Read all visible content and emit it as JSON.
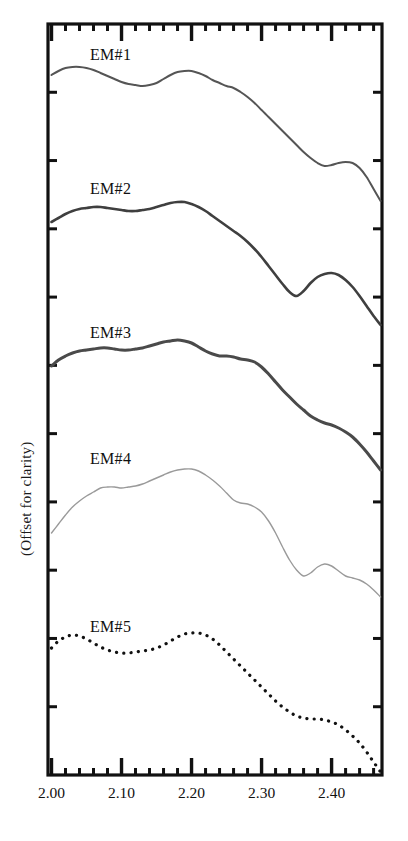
{
  "chart_data": {
    "type": "line",
    "title": "",
    "xlabel": "",
    "ylabel": "(Offset for clarity)",
    "xlim": [
      1.995,
      2.472
    ],
    "ylim": [
      0,
      1
    ],
    "grid": false,
    "legend_position": "inline-curve-labels",
    "xticks_major": [
      "2.00",
      "2.10",
      "2.20",
      "2.30",
      "2.40"
    ],
    "xtick_major_values": [
      2.0,
      2.1,
      2.2,
      2.3,
      2.4
    ],
    "xtick_minor_step": 0.02,
    "xtick_medium_step": 0.05,
    "ytick_count": 11,
    "series": [
      {
        "name": "EM#1",
        "label": "EM#1",
        "color": "#555555",
        "style": "solid",
        "width": 2.0,
        "label_x": 2.055,
        "label_y_px": 62,
        "x": [
          2.0,
          2.01,
          2.02,
          2.03,
          2.04,
          2.05,
          2.06,
          2.07,
          2.08,
          2.09,
          2.1,
          2.11,
          2.12,
          2.13,
          2.14,
          2.15,
          2.16,
          2.17,
          2.18,
          2.19,
          2.2,
          2.21,
          2.22,
          2.23,
          2.24,
          2.25,
          2.26,
          2.27,
          2.28,
          2.29,
          2.3,
          2.31,
          2.32,
          2.33,
          2.34,
          2.35,
          2.36,
          2.37,
          2.38,
          2.39,
          2.4,
          2.41,
          2.42,
          2.43,
          2.44,
          2.45,
          2.46,
          2.47
        ],
        "y_px": [
          75,
          71,
          68,
          67,
          67,
          68,
          70,
          73,
          76,
          79,
          82,
          84,
          85,
          86,
          85,
          83,
          79,
          75,
          72,
          71,
          71,
          73,
          76,
          80,
          83,
          86,
          88,
          92,
          97,
          103,
          110,
          117,
          124,
          131,
          138,
          145,
          152,
          158,
          163,
          166,
          165,
          163,
          162,
          163,
          168,
          177,
          189,
          201
        ]
      },
      {
        "name": "EM#2",
        "label": "EM#2",
        "color": "#3f3f3f",
        "style": "solid",
        "width": 2.6,
        "label_x": 2.055,
        "label_y_px": 196,
        "x": [
          2.0,
          2.01,
          2.02,
          2.03,
          2.04,
          2.05,
          2.06,
          2.07,
          2.08,
          2.09,
          2.1,
          2.11,
          2.12,
          2.13,
          2.14,
          2.15,
          2.16,
          2.17,
          2.18,
          2.19,
          2.2,
          2.21,
          2.22,
          2.23,
          2.24,
          2.25,
          2.26,
          2.27,
          2.28,
          2.29,
          2.3,
          2.31,
          2.32,
          2.33,
          2.34,
          2.35,
          2.36,
          2.37,
          2.38,
          2.39,
          2.4,
          2.41,
          2.42,
          2.43,
          2.44,
          2.45,
          2.46,
          2.47
        ],
        "y_px": [
          222,
          218,
          214,
          211,
          209,
          208,
          207,
          207,
          208,
          209,
          210,
          211,
          211,
          210,
          209,
          207,
          205,
          203,
          202,
          202,
          204,
          207,
          211,
          216,
          221,
          226,
          231,
          236,
          242,
          249,
          257,
          266,
          275,
          284,
          292,
          296,
          291,
          283,
          277,
          274,
          273,
          275,
          280,
          287,
          296,
          306,
          316,
          325
        ]
      },
      {
        "name": "EM#3",
        "label": "EM#3",
        "color": "#4a4a4a",
        "style": "solid",
        "width": 3.0,
        "label_x": 2.055,
        "label_y_px": 340,
        "x": [
          2.0,
          2.01,
          2.02,
          2.03,
          2.04,
          2.05,
          2.06,
          2.07,
          2.08,
          2.09,
          2.1,
          2.11,
          2.12,
          2.13,
          2.14,
          2.15,
          2.16,
          2.17,
          2.18,
          2.19,
          2.2,
          2.21,
          2.22,
          2.23,
          2.24,
          2.25,
          2.26,
          2.27,
          2.28,
          2.29,
          2.3,
          2.31,
          2.32,
          2.33,
          2.34,
          2.35,
          2.36,
          2.37,
          2.38,
          2.39,
          2.4,
          2.41,
          2.42,
          2.43,
          2.44,
          2.45,
          2.46,
          2.47
        ],
        "y_px": [
          366,
          360,
          356,
          353,
          351,
          350,
          349,
          348,
          348,
          349,
          350,
          350,
          349,
          348,
          346,
          344,
          342,
          341,
          340,
          341,
          343,
          347,
          351,
          354,
          356,
          356,
          357,
          359,
          360,
          362,
          367,
          374,
          382,
          390,
          397,
          404,
          410,
          416,
          420,
          423,
          425,
          428,
          432,
          437,
          444,
          452,
          461,
          470
        ]
      },
      {
        "name": "EM#4",
        "label": "EM#4",
        "color": "#9a9a9a",
        "style": "solid",
        "width": 1.4,
        "label_x": 2.055,
        "label_y_px": 466,
        "x": [
          2.0,
          2.01,
          2.02,
          2.03,
          2.04,
          2.05,
          2.06,
          2.07,
          2.08,
          2.09,
          2.1,
          2.11,
          2.12,
          2.13,
          2.14,
          2.15,
          2.16,
          2.17,
          2.18,
          2.19,
          2.2,
          2.21,
          2.22,
          2.23,
          2.24,
          2.25,
          2.26,
          2.27,
          2.28,
          2.29,
          2.3,
          2.31,
          2.32,
          2.33,
          2.34,
          2.35,
          2.36,
          2.37,
          2.38,
          2.39,
          2.4,
          2.41,
          2.42,
          2.43,
          2.44,
          2.45,
          2.46,
          2.47
        ],
        "y_px": [
          533,
          524,
          515,
          507,
          501,
          496,
          492,
          488,
          487,
          487,
          488,
          487,
          486,
          484,
          481,
          478,
          475,
          472,
          470,
          469,
          469,
          471,
          475,
          480,
          486,
          493,
          500,
          503,
          504,
          507,
          512,
          521,
          533,
          547,
          560,
          570,
          576,
          573,
          567,
          564,
          566,
          571,
          576,
          578,
          580,
          584,
          590,
          597
        ]
      },
      {
        "name": "EM#5",
        "label": "EM#5",
        "color": "#111111",
        "style": "dotted",
        "width": 3.2,
        "label_x": 2.055,
        "label_y_px": 634,
        "x": [
          2.0,
          2.01,
          2.02,
          2.03,
          2.04,
          2.05,
          2.06,
          2.07,
          2.08,
          2.09,
          2.1,
          2.11,
          2.12,
          2.13,
          2.14,
          2.15,
          2.16,
          2.17,
          2.18,
          2.19,
          2.2,
          2.21,
          2.22,
          2.23,
          2.24,
          2.25,
          2.26,
          2.27,
          2.28,
          2.29,
          2.3,
          2.31,
          2.32,
          2.33,
          2.34,
          2.35,
          2.36,
          2.37,
          2.38,
          2.39,
          2.4,
          2.41,
          2.42,
          2.43,
          2.44,
          2.45,
          2.46,
          2.47
        ],
        "y_px": [
          648,
          641,
          637,
          635,
          636,
          639,
          643,
          647,
          650,
          652,
          653,
          653,
          652,
          651,
          650,
          648,
          645,
          641,
          637,
          634,
          633,
          633,
          635,
          639,
          645,
          652,
          659,
          666,
          673,
          680,
          687,
          694,
          701,
          707,
          712,
          716,
          718,
          719,
          719,
          720,
          722,
          725,
          730,
          736,
          743,
          752,
          762,
          772
        ]
      }
    ]
  },
  "axis": {
    "ylabel": "(Offset for clarity)",
    "xtick_labels": [
      "2.00",
      "2.10",
      "2.20",
      "2.30",
      "2.40"
    ]
  },
  "frame": {
    "left_px": 48,
    "right_px": 382,
    "top_px": 24,
    "bottom_px": 775,
    "border_color": "#111111"
  }
}
